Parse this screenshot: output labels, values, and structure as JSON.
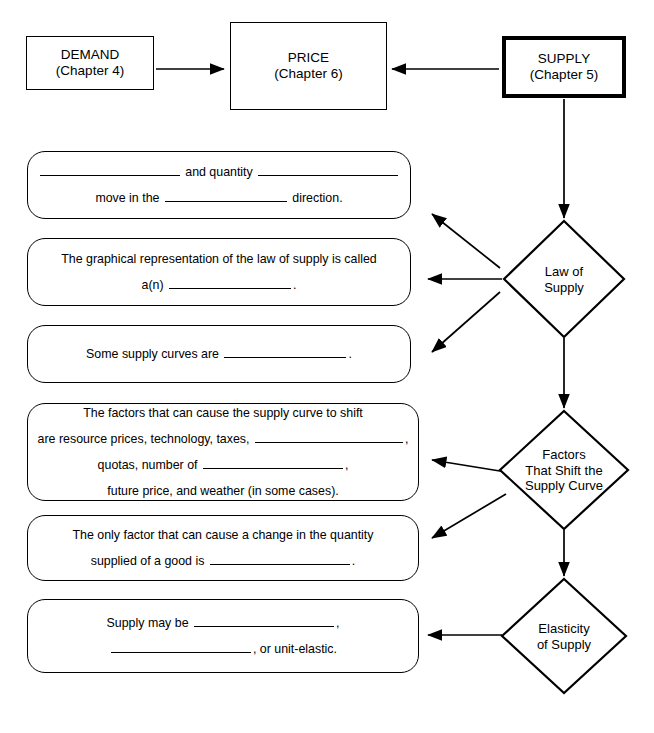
{
  "diagram": {
    "top_nodes": [
      {
        "id": "demand",
        "line1": "DEMAND",
        "line2": "(Chapter 4)",
        "emphasis": "normal"
      },
      {
        "id": "price",
        "line1": "PRICE",
        "line2": "(Chapter 6)",
        "emphasis": "normal"
      },
      {
        "id": "supply",
        "line1": "SUPPLY",
        "line2": "(Chapter 5)",
        "emphasis": "thick"
      }
    ],
    "diamonds": [
      {
        "id": "law-of-supply",
        "label": "Law of\nSupply"
      },
      {
        "id": "factors-that-shift",
        "label": "Factors\nThat Shift the\nSupply Curve"
      },
      {
        "id": "elasticity",
        "label": "Elasticity\nof Supply"
      }
    ],
    "statements": [
      {
        "id": "statement-1",
        "lines": [
          [
            {
              "t": "blank",
              "w": "b-lg"
            },
            {
              "t": "text",
              "v": " and quantity "
            },
            {
              "t": "blank",
              "w": "b-lg"
            }
          ],
          [
            {
              "t": "text",
              "v": "move in the "
            },
            {
              "t": "blank",
              "w": "b-md"
            },
            {
              "t": "text",
              "v": " direction."
            }
          ]
        ]
      },
      {
        "id": "statement-2",
        "lines": [
          [
            {
              "t": "text",
              "v": "The graphical representation of the law of supply is called"
            }
          ],
          [
            {
              "t": "text",
              "v": "a(n) "
            },
            {
              "t": "blank",
              "w": "b-md"
            },
            {
              "t": "text",
              "v": "."
            }
          ]
        ]
      },
      {
        "id": "statement-3",
        "lines": [
          [
            {
              "t": "text",
              "v": "Some supply curves are "
            },
            {
              "t": "blank",
              "w": "b-md"
            },
            {
              "t": "text",
              "v": "."
            }
          ]
        ]
      },
      {
        "id": "statement-4",
        "lines": [
          [
            {
              "t": "text",
              "v": "The factors that can cause the supply curve to shift"
            }
          ],
          [
            {
              "t": "text",
              "v": "are resource prices, technology, taxes, "
            },
            {
              "t": "blank",
              "w": "b-xl"
            },
            {
              "t": "text",
              "v": ","
            }
          ],
          [
            {
              "t": "text",
              "v": "quotas, number of "
            },
            {
              "t": "blank",
              "w": "b-lg"
            },
            {
              "t": "text",
              "v": ","
            }
          ],
          [
            {
              "t": "text",
              "v": "future price, and weather (in some cases)."
            }
          ]
        ]
      },
      {
        "id": "statement-5",
        "lines": [
          [
            {
              "t": "text",
              "v": "The only factor that can cause a change in the quantity"
            }
          ],
          [
            {
              "t": "text",
              "v": "supplied of a good is "
            },
            {
              "t": "blank",
              "w": "b-lg"
            },
            {
              "t": "text",
              "v": "."
            }
          ]
        ]
      },
      {
        "id": "statement-6",
        "lines": [
          [
            {
              "t": "text",
              "v": "Supply may be "
            },
            {
              "t": "blank",
              "w": "b-lg"
            },
            {
              "t": "text",
              "v": ","
            }
          ],
          [
            {
              "t": "blank",
              "w": "b-lg"
            },
            {
              "t": "text",
              "v": ", or unit-elastic."
            }
          ]
        ]
      }
    ],
    "colors": {
      "stroke": "#000000",
      "background": "#ffffff",
      "text": "#000000"
    }
  }
}
